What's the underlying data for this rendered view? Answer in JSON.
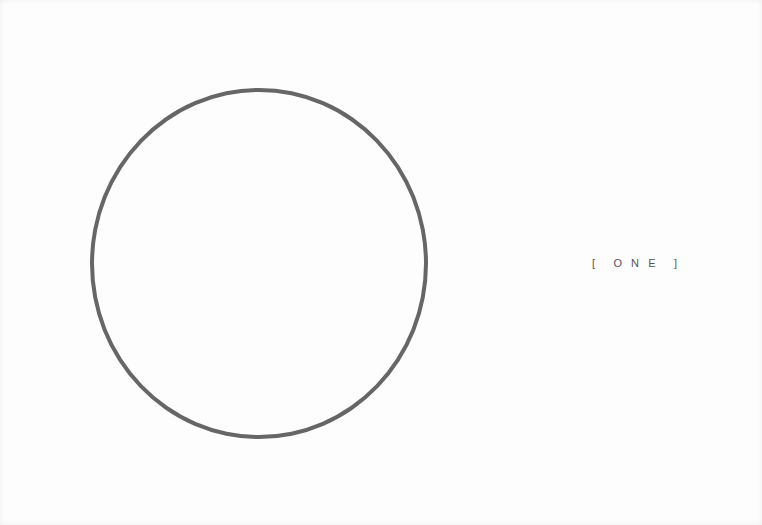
{
  "label": {
    "text": "[      O   N   E      ]"
  },
  "shape": {
    "type": "circle-outline",
    "stroke_color": "#666666"
  }
}
